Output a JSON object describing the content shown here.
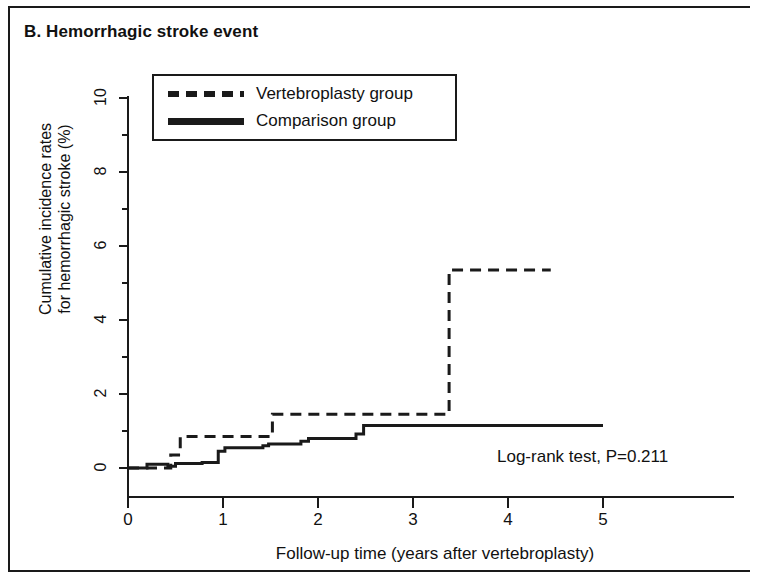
{
  "panel": {
    "label": "B. Hemorrhagic stroke event"
  },
  "annotation": {
    "text": "Log-rank test, P=0.211"
  },
  "legend": {
    "items": [
      {
        "label": "Vertebroplasty group",
        "style": "dashed"
      },
      {
        "label": "Comparison group",
        "style": "solid"
      }
    ]
  },
  "axes": {
    "y_title_line1": "Cumulative incidence rates",
    "y_title_line2": "for hemorrhagic stroke (%)",
    "x_title": "Follow-up time (years after vertebroplasty)",
    "y_ticks": [
      "0",
      "2",
      "4",
      "6",
      "8",
      "10"
    ],
    "x_ticks": [
      "0",
      "1",
      "2",
      "3",
      "4",
      "5"
    ]
  },
  "chart_data": {
    "type": "line",
    "subtype": "kaplan-meier-cumulative-incidence-step",
    "title": "B. Hemorrhagic stroke event",
    "xlabel": "Follow-up time (years after vertebroplasty)",
    "ylabel": "Cumulative incidence rates for hemorrhagic stroke (%)",
    "xlim": [
      0,
      5
    ],
    "ylim": [
      0,
      10
    ],
    "xticks": [
      0,
      1,
      2,
      3,
      4,
      5
    ],
    "yticks": [
      0,
      2,
      4,
      6,
      8,
      10
    ],
    "y_minor_ticks": [
      1,
      3,
      5,
      7,
      9
    ],
    "grid": false,
    "legend_position": "upper-left-inset-box",
    "annotations": [
      {
        "text": "Log-rank test, P=0.211",
        "x": 3.9,
        "y": 0.6
      }
    ],
    "series": [
      {
        "name": "Vertebroplasty group",
        "style": "dashed",
        "color": "#1a1a1a",
        "x": [
          0.0,
          0.45,
          0.45,
          0.55,
          0.55,
          0.82,
          0.82,
          1.52,
          1.52,
          3.38,
          3.38,
          4.45
        ],
        "y": [
          0.0,
          0.0,
          0.35,
          0.35,
          0.85,
          0.85,
          0.85,
          0.85,
          1.45,
          1.45,
          5.35,
          5.35
        ],
        "steps": [
          {
            "time": 0.45,
            "value": 0.35
          },
          {
            "time": 0.55,
            "value": 0.85
          },
          {
            "time": 1.52,
            "value": 1.45
          },
          {
            "time": 3.38,
            "value": 5.35
          }
        ],
        "last_observed_time": 4.45,
        "final_value": 5.35
      },
      {
        "name": "Comparison group",
        "style": "solid",
        "color": "#1a1a1a",
        "x": [
          0.0,
          0.2,
          0.2,
          0.42,
          0.42,
          0.5,
          0.5,
          0.78,
          0.78,
          0.95,
          0.95,
          1.02,
          1.02,
          1.42,
          1.42,
          1.48,
          1.48,
          1.82,
          1.82,
          1.9,
          1.9,
          2.4,
          2.4,
          2.48,
          2.48,
          5.0
        ],
        "y": [
          0.0,
          0.0,
          0.1,
          0.1,
          0.05,
          0.05,
          0.12,
          0.12,
          0.15,
          0.15,
          0.45,
          0.45,
          0.55,
          0.55,
          0.6,
          0.6,
          0.65,
          0.65,
          0.72,
          0.72,
          0.8,
          0.8,
          0.92,
          0.92,
          1.15,
          1.15
        ],
        "steps": [
          {
            "time": 0.2,
            "value": 0.1
          },
          {
            "time": 0.5,
            "value": 0.12
          },
          {
            "time": 0.78,
            "value": 0.15
          },
          {
            "time": 0.95,
            "value": 0.45
          },
          {
            "time": 1.02,
            "value": 0.55
          },
          {
            "time": 1.42,
            "value": 0.6
          },
          {
            "time": 1.48,
            "value": 0.65
          },
          {
            "time": 1.82,
            "value": 0.72
          },
          {
            "time": 1.9,
            "value": 0.8
          },
          {
            "time": 2.4,
            "value": 0.92
          },
          {
            "time": 2.48,
            "value": 1.15
          }
        ],
        "last_observed_time": 5.0,
        "final_value": 1.15
      }
    ]
  },
  "colors": {
    "ink": "#1a1a1a",
    "background": "#ffffff"
  }
}
